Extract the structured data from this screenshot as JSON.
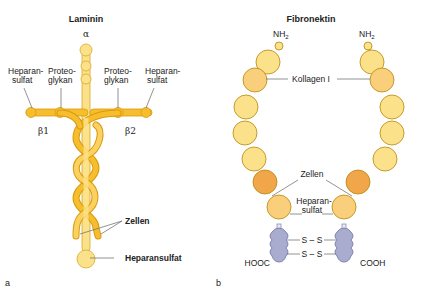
{
  "colors": {
    "pale_yellow": "#fbe28a",
    "yellow": "#fbd160",
    "gold": "#f6bd2c",
    "gold_dark": "#d99a10",
    "light_orange": "#f9cf7c",
    "orange": "#f1a64a",
    "gray_blue": "#a9abcf",
    "outline": "#b8860b",
    "leader": "#777777"
  },
  "panel_a": {
    "title": "Laminin",
    "panel_letter": "a",
    "chain_alpha": "α",
    "chain_beta1": "β1",
    "chain_beta2": "β2",
    "labels": {
      "heparansulfat_left_l1": "Heparan-",
      "heparansulfat_left_l2": "sulfat",
      "proteoglykan_left_l1": "Proteo-",
      "proteoglykan_left_l2": "glykan",
      "proteoglykan_right_l1": "Proteo-",
      "proteoglykan_right_l2": "glykan",
      "heparansulfat_right_l1": "Heparan-",
      "heparansulfat_right_l2": "sulfat",
      "zellen": "Zellen",
      "heparansulfat_bottom": "Heparansulfat"
    }
  },
  "panel_b": {
    "title": "Fibronektin",
    "panel_letter": "b",
    "labels": {
      "nh2_left": "NH",
      "nh2_left_sub": "2",
      "nh2_right": "NH",
      "nh2_right_sub": "2",
      "kollagen": "Kollagen I",
      "zellen": "Zellen",
      "heparansulfat_l1": "Heparan-",
      "heparansulfat_l2": "sulfat",
      "disulfide_top": "S – S",
      "disulfide_bottom": "S – S",
      "hooc": "HOOC",
      "cooh": "COOH"
    }
  }
}
